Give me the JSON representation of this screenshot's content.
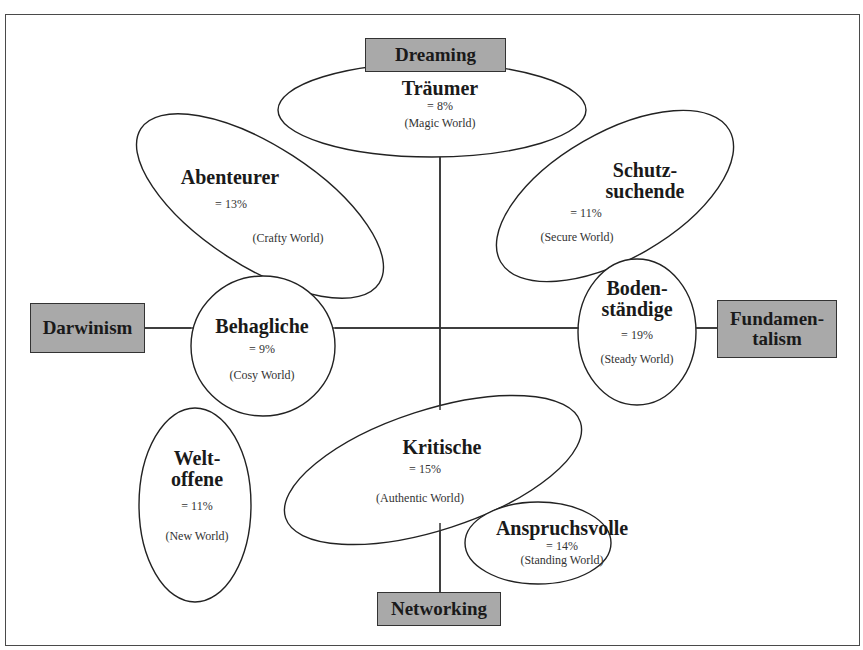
{
  "axes": {
    "top": "Dreaming",
    "bottom": "Networking",
    "left": "Darwinism",
    "right_line1": "Fundamen-",
    "right_line2": "talism"
  },
  "segments": [
    {
      "id": "traeumer",
      "name": "Träumer",
      "percent": "= 8%",
      "world": "(Magic World)"
    },
    {
      "id": "abenteurer",
      "name": "Abenteurer",
      "percent": "= 13%",
      "world": "(Crafty World)"
    },
    {
      "id": "schutzsuchende",
      "name_line1": "Schutz-",
      "name_line2": "suchende",
      "percent": "= 11%",
      "world": "(Secure World)"
    },
    {
      "id": "behagliche",
      "name": "Behagliche",
      "percent": "= 9%",
      "world": "(Cosy World)"
    },
    {
      "id": "bodenstaendige",
      "name_line1": "Boden-",
      "name_line2": "ständige",
      "percent": "= 19%",
      "world": "(Steady World)"
    },
    {
      "id": "weltoffene",
      "name_line1": "Welt-",
      "name_line2": "offene",
      "percent": "= 11%",
      "world": "(New World)"
    },
    {
      "id": "kritische",
      "name": "Kritische",
      "percent": "= 15%",
      "world": "(Authentic World)"
    },
    {
      "id": "anspruchsvolle",
      "name": "Anspruchsvolle",
      "percent": "= 14%",
      "world": "(Standing World)"
    }
  ],
  "colors": {
    "axis_box_fill": "#a9a9a9",
    "line": "#333333",
    "background": "#ffffff"
  }
}
